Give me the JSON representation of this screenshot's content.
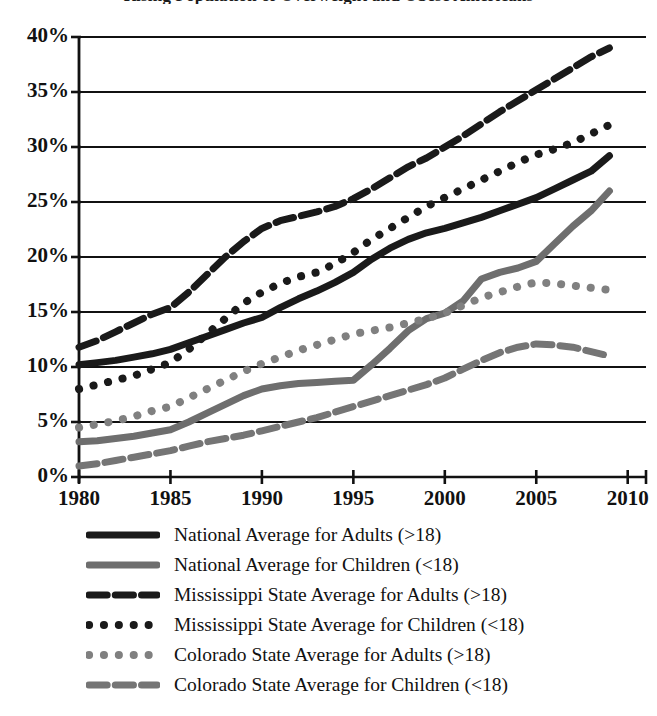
{
  "figure": {
    "title_partial": "Rising Population of Overweight and Obese Americans"
  },
  "chart_data": {
    "type": "line",
    "title": "Rising Population of Overweight and Obese Americans",
    "xlabel": "",
    "ylabel": "",
    "xlim": [
      1980,
      2011
    ],
    "ylim": [
      0,
      40
    ],
    "ytick_labels": [
      "0%",
      "5%",
      "10%",
      "15%",
      "20%",
      "25%",
      "30%",
      "35%",
      "40%"
    ],
    "ytick_values": [
      0,
      5,
      10,
      15,
      20,
      25,
      30,
      35,
      40
    ],
    "xtick_labels": [
      "1980",
      "1985",
      "1990",
      "1995",
      "2000",
      "2005",
      "2010"
    ],
    "xtick_values": [
      1980,
      1985,
      1990,
      1995,
      2000,
      2005,
      2010
    ],
    "grid": "horizontal",
    "legend_position": "below",
    "x": [
      1980,
      1981,
      1982,
      1983,
      1984,
      1985,
      1986,
      1987,
      1988,
      1989,
      1990,
      1991,
      1992,
      1993,
      1994,
      1995,
      1996,
      1997,
      1998,
      1999,
      2000,
      2001,
      2002,
      2003,
      2004,
      2005,
      2006,
      2007,
      2008,
      2009
    ],
    "series": [
      {
        "name": "National Average for Adults (>18)",
        "color": "#1a1a1a",
        "style": "solid",
        "width": 7,
        "values": [
          10.2,
          10.4,
          10.6,
          10.9,
          11.2,
          11.6,
          12.2,
          12.8,
          13.4,
          14.0,
          14.5,
          15.4,
          16.2,
          16.9,
          17.7,
          18.6,
          19.8,
          20.8,
          21.6,
          22.2,
          22.6,
          23.1,
          23.6,
          24.2,
          24.8,
          25.4,
          26.2,
          27.0,
          27.8,
          29.2
        ]
      },
      {
        "name": "National Average for Children (<18)",
        "color": "#6e6e6e",
        "style": "solid",
        "width": 7,
        "values": [
          3.2,
          3.3,
          3.5,
          3.7,
          4.0,
          4.3,
          5.0,
          5.8,
          6.6,
          7.4,
          8.0,
          8.3,
          8.5,
          8.6,
          8.7,
          8.8,
          10.2,
          11.7,
          13.3,
          14.4,
          14.9,
          16.0,
          18.0,
          18.6,
          19.0,
          19.6,
          21.2,
          22.8,
          24.2,
          26.0
        ]
      },
      {
        "name": "Mississippi State Average for Adults (>18)",
        "color": "#1a1a1a",
        "style": "dashed",
        "width": 7,
        "values": [
          11.8,
          12.4,
          13.2,
          14.0,
          14.8,
          15.4,
          16.8,
          18.4,
          20.0,
          21.4,
          22.6,
          23.3,
          23.7,
          24.1,
          24.6,
          25.3,
          26.2,
          27.2,
          28.2,
          29.0,
          30.0,
          31.0,
          32.1,
          33.2,
          34.2,
          35.2,
          36.2,
          37.2,
          38.2,
          39.0
        ]
      },
      {
        "name": "Mississippi State Average for Children (<18)",
        "color": "#1a1a1a",
        "style": "dotted",
        "width": 8,
        "values": [
          8.0,
          8.4,
          8.8,
          9.2,
          9.8,
          10.4,
          11.6,
          13.0,
          14.4,
          15.8,
          16.8,
          17.6,
          18.2,
          18.6,
          19.4,
          20.4,
          21.6,
          22.6,
          23.6,
          24.6,
          25.4,
          26.2,
          27.0,
          27.8,
          28.6,
          29.3,
          29.8,
          30.4,
          31.2,
          32.0
        ]
      },
      {
        "name": "Colorado State Average for Adults (>18)",
        "color": "#808080",
        "style": "dotted",
        "width": 8,
        "values": [
          4.5,
          4.8,
          5.1,
          5.5,
          6.0,
          6.4,
          7.2,
          8.0,
          8.8,
          9.6,
          10.3,
          10.9,
          11.5,
          12.0,
          12.5,
          13.0,
          13.3,
          13.6,
          14.0,
          14.4,
          14.9,
          15.6,
          16.3,
          16.8,
          17.3,
          17.7,
          17.6,
          17.4,
          17.2,
          17.0
        ]
      },
      {
        "name": "Colorado State Average for Children (<18)",
        "color": "#757575",
        "style": "dashed",
        "width": 7,
        "values": [
          1.0,
          1.2,
          1.5,
          1.8,
          2.1,
          2.4,
          2.8,
          3.2,
          3.5,
          3.8,
          4.2,
          4.6,
          5.0,
          5.4,
          5.9,
          6.4,
          6.9,
          7.4,
          7.9,
          8.4,
          9.0,
          9.8,
          10.6,
          11.3,
          11.8,
          12.1,
          12.0,
          11.8,
          11.4,
          11.0
        ]
      }
    ]
  },
  "legend": {
    "items": [
      {
        "label": "National Average for Adults (>18)",
        "color": "#1a1a1a",
        "style": "solid"
      },
      {
        "label": "National Average for Children (<18)",
        "color": "#6e6e6e",
        "style": "solid"
      },
      {
        "label": "Mississippi State Average for Adults (>18)",
        "color": "#1a1a1a",
        "style": "dashed"
      },
      {
        "label": "Mississippi State Average for Children (<18)",
        "color": "#1a1a1a",
        "style": "dotted"
      },
      {
        "label": "Colorado State Average for Adults (>18)",
        "color": "#808080",
        "style": "dotted"
      },
      {
        "label": "Colorado State Average for Children (<18)",
        "color": "#757575",
        "style": "dashed"
      }
    ]
  }
}
